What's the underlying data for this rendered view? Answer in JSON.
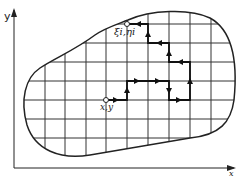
{
  "diagram": {
    "axes": {
      "y_label": "y",
      "x_label": "x"
    },
    "start_point_label": "x,y",
    "end_point_label": "ξi,ηi",
    "colors": {
      "line": "#222222",
      "background": "#ffffff"
    },
    "grid": {
      "vertical_x": [
        45,
        65,
        86,
        106,
        127,
        148,
        169,
        190,
        211
      ],
      "horizontal_y": [
        24,
        43,
        62,
        81,
        100,
        119,
        138
      ]
    },
    "path_description": "Random walk from (x,y) through grid nodes to boundary point (ξi,ηi)"
  }
}
